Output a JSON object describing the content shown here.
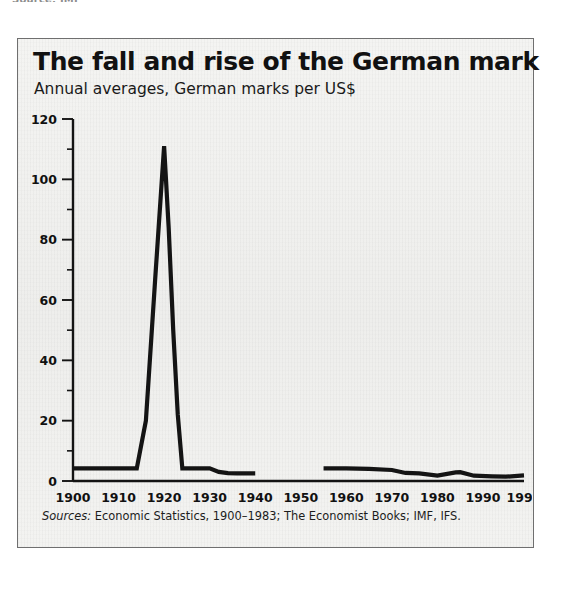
{
  "page": {
    "clipped_top_text": "Source: IMF"
  },
  "chart_panel": {
    "title": "The fall and rise of the German mark",
    "subtitle": "Annual averages, German marks per US$",
    "source_label": "Sources:",
    "source_text": " Economic Statistics, 1900–1983; The Economist Books; IMF, IFS.",
    "frame_color": "#6f6f6f",
    "background_color": "#f2f2f0",
    "line_color": "#141414",
    "axis_color": "#141414"
  },
  "chart_data": {
    "type": "line",
    "title": "The fall and rise of the German mark",
    "subtitle": "Annual averages, German marks per US$",
    "xlabel": "",
    "ylabel": "German marks per US$",
    "xlim": [
      1900,
      1999
    ],
    "ylim": [
      0,
      120
    ],
    "grid": false,
    "legend": "none",
    "y_ticks_major": [
      0,
      20,
      40,
      60,
      80,
      100,
      120
    ],
    "y_ticks_minor": [
      10,
      30,
      50,
      70,
      90,
      110
    ],
    "x_ticks": [
      1900,
      1910,
      1920,
      1930,
      1940,
      1950,
      1960,
      1970,
      1980,
      1990,
      1999
    ],
    "x_tick_labels": [
      "1900",
      "1910",
      "1920",
      "1930",
      "1940",
      "1950",
      "1960",
      "1970",
      "1980",
      "1990",
      "1999"
    ],
    "y_tick_labels": [
      "0",
      "20",
      "40",
      "60",
      "80",
      "100",
      "120"
    ],
    "annotations": [
      "Data gap between 1940 and 1955 (Second World War and currency reform)"
    ],
    "series": [
      {
        "name": "German marks per US$ (pre-war, Reichsmark era)",
        "x": [
          1900,
          1905,
          1910,
          1914,
          1916,
          1918,
          1920,
          1921,
          1922,
          1923,
          1924,
          1926,
          1928,
          1930,
          1932,
          1934,
          1936,
          1938,
          1940
        ],
        "values": [
          4.2,
          4.2,
          4.2,
          4.2,
          20,
          66,
          111,
          84,
          50,
          22,
          4.2,
          4.2,
          4.2,
          4.2,
          3.0,
          2.6,
          2.5,
          2.5,
          2.5
        ]
      },
      {
        "name": "German marks per US$ (post-war, Deutsche Mark era)",
        "x": [
          1955,
          1960,
          1965,
          1970,
          1973,
          1976,
          1980,
          1984,
          1985,
          1988,
          1992,
          1995,
          1999
        ],
        "values": [
          4.2,
          4.17,
          4.0,
          3.65,
          2.67,
          2.52,
          1.82,
          2.85,
          2.94,
          1.76,
          1.56,
          1.43,
          1.84
        ]
      }
    ]
  }
}
